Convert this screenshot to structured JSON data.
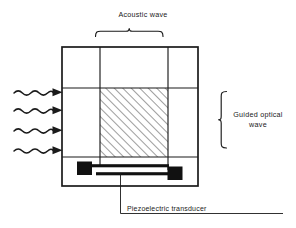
{
  "figure": {
    "kind": "acousto-optic-waveguide-modulator-diagram",
    "background_color": "#ffffff",
    "line_color": "#1a1a1a",
    "fill_color": "#111111",
    "labels": {
      "acoustic_wave": "Acoustic wave",
      "guided_optical_wave_line1": "Guided optical",
      "guided_optical_wave_line2": "wave",
      "piezoelectric_transducer": "Piezoelectric transducer"
    },
    "components": {
      "substrate_label": "substrate-outline",
      "waveguide_label": "optical-waveguide-channel",
      "acoustic_column_label": "acoustic-beam-column",
      "interaction_label": "hatched-interaction-region",
      "transducer_label": "interdigital-transducer",
      "pad_left_label": "transducer-pad-left",
      "pad_right_label": "transducer-pad-right",
      "input_waves_label": "incident-optical-waves",
      "input_wave_count": 4
    },
    "geometry": {
      "outer_box": {
        "x": 62,
        "y": 47,
        "w": 136,
        "h": 139
      },
      "acoustic_column": {
        "x1": 100,
        "x2": 168
      },
      "waveguide_band": {
        "y1": 88,
        "y2": 157
      },
      "hatch_region": {
        "x": 100,
        "y": 88,
        "w": 68,
        "h": 69
      },
      "acoustic_brace": {
        "x1": 95,
        "x2": 163,
        "y": 31
      },
      "optical_brace": {
        "x": 219,
        "y1": 92,
        "y2": 152
      },
      "wave_arrow_ys": [
        92,
        110,
        130,
        150
      ]
    }
  }
}
